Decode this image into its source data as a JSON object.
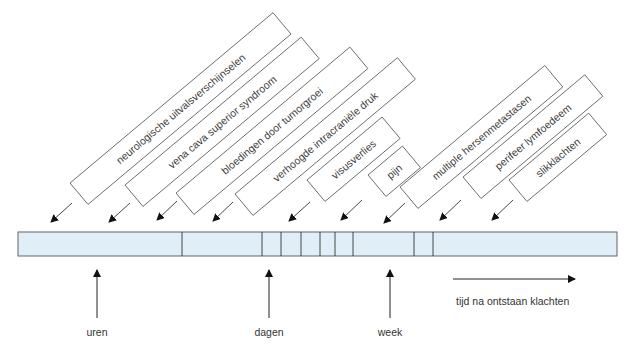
{
  "diagram": {
    "type": "timeline",
    "colors": {
      "bar_fill": "#dfeef7",
      "bar_stroke": "#555555",
      "box_stroke": "#6b6b6b",
      "text": "#333333"
    },
    "symptoms": [
      {
        "label": "neurologische uitvalsverschijnselen",
        "x": 70,
        "y": 183,
        "len": 265
      },
      {
        "label": "vena cava superior syndroom",
        "x": 125,
        "y": 185,
        "len": 230
      },
      {
        "label": "bloedingen door tumorgroei",
        "x": 176,
        "y": 193,
        "len": 227
      },
      {
        "label": "verhoogde intracraniële druk",
        "x": 235,
        "y": 194,
        "len": 212
      },
      {
        "label": "visusverlies",
        "x": 307,
        "y": 180,
        "len": 98
      },
      {
        "label": "pijn",
        "x": 368,
        "y": 175,
        "len": 45
      },
      {
        "label": "multiple hersenmetastasen",
        "x": 400,
        "y": 187,
        "len": 189
      },
      {
        "label": "perifeer lymfoedeem",
        "x": 463,
        "y": 177,
        "len": 159
      },
      {
        "label": "slikklachten",
        "x": 509,
        "y": 180,
        "len": 104
      }
    ],
    "timeline_bar": {
      "x0": 18,
      "x1": 617,
      "y0": 232,
      "y1": 256,
      "dividers": [
        182,
        262,
        281,
        301,
        320,
        335,
        353,
        414,
        433
      ]
    },
    "time_markers": [
      {
        "label": "uren",
        "x": 97
      },
      {
        "label": "dagen",
        "x": 269
      },
      {
        "label": "week",
        "x": 390
      }
    ],
    "time_arrow": {
      "label": "tijd na ontstaan klachten"
    }
  }
}
